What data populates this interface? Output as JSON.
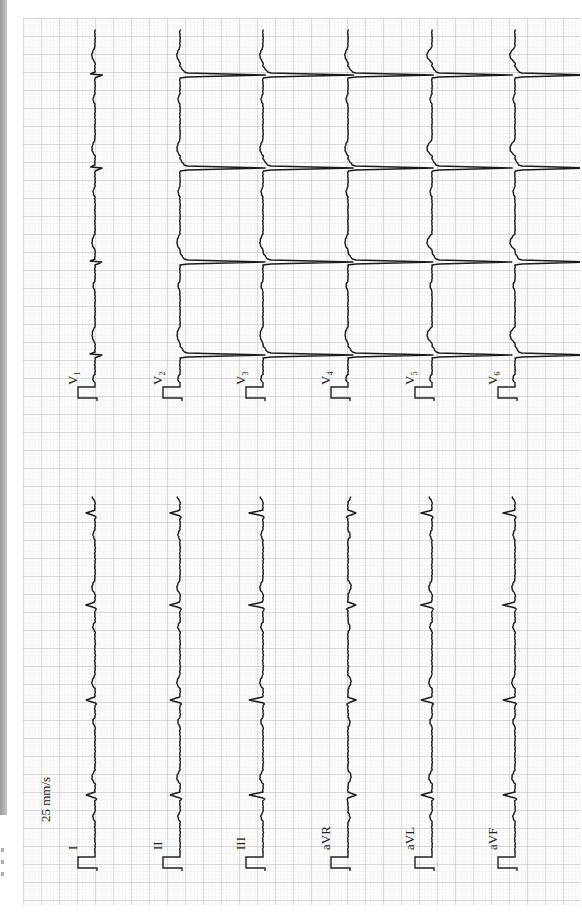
{
  "ecg": {
    "paper_speed": "25 mm/s",
    "orientation": "rotated-90-ccw",
    "grid": {
      "minor_color": "#d9d9d9",
      "major_color": "#a8a8a8",
      "background": "#ffffff",
      "minor_px": 3.6,
      "major_px": 18
    },
    "trace_color": "#1a1a1a",
    "limb_leads": [
      {
        "label": "I",
        "sub": ""
      },
      {
        "label": "II",
        "sub": ""
      },
      {
        "label": "III",
        "sub": ""
      },
      {
        "label": "aVR",
        "sub": ""
      },
      {
        "label": "aVL",
        "sub": ""
      },
      {
        "label": "aVF",
        "sub": ""
      }
    ],
    "chest_leads": [
      {
        "label": "V",
        "sub": "1"
      },
      {
        "label": "V",
        "sub": "2"
      },
      {
        "label": "V",
        "sub": "3"
      },
      {
        "label": "V",
        "sub": "4"
      },
      {
        "label": "V",
        "sub": "5"
      },
      {
        "label": "V",
        "sub": "6"
      }
    ],
    "baselines_x": [
      95,
      180,
      263,
      348,
      432,
      515
    ],
    "limb_qrs_y": [
      513,
      605,
      700,
      795
    ],
    "chest_qrs_y": [
      75,
      168,
      262,
      355
    ],
    "limb_polarity": [
      1,
      1,
      1,
      -1,
      1,
      1
    ],
    "limb_amplitude": [
      9,
      10,
      14,
      8,
      11,
      12
    ],
    "chest_amplitude": [
      7,
      85,
      90,
      85,
      80,
      75
    ]
  }
}
